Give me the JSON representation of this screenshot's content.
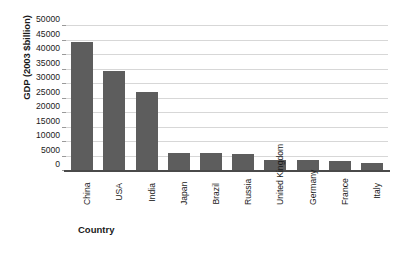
{
  "chart_data": {
    "type": "bar",
    "title": "",
    "xlabel": "Country",
    "ylabel": "GDP (2003 $billion)",
    "categories": [
      "China",
      "USA",
      "India",
      "Japan",
      "Brazil",
      "Russia",
      "United Kingdom",
      "Germany",
      "France",
      "Italy"
    ],
    "values": [
      44000,
      34000,
      27000,
      5700,
      5700,
      5400,
      3500,
      3500,
      3100,
      2300
    ],
    "series": [
      {
        "name": "GDP (2003 $billion)",
        "values": [
          44000,
          34000,
          27000,
          5700,
          5700,
          5400,
          3500,
          3500,
          3100,
          2300
        ]
      }
    ],
    "ylim": [
      0,
      50000
    ],
    "ytick_values": [
      0,
      5000,
      10000,
      15000,
      20000,
      25000,
      30000,
      35000,
      40000,
      45000,
      50000
    ],
    "ytick_labels": [
      "0",
      "5000",
      "10000",
      "15000",
      "20000",
      "25000",
      "30000",
      "35000",
      "40000",
      "45000",
      "50000"
    ],
    "grid": true,
    "grid_axis": "y",
    "legend": false,
    "legend_position": "none",
    "bar_color": "#5d5d5d",
    "gridline_color": "#d7d7d7",
    "axis_color": "#4a4a4a",
    "background_color": "#ffffff"
  }
}
